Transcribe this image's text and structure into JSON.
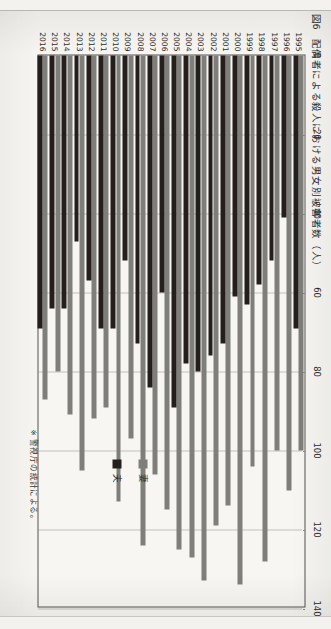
{
  "figure": {
    "number": "図6",
    "title": "配偶者による殺人における男女別被害者数（人）",
    "note": "※ 警視庁の統計による。"
  },
  "legend": {
    "position": "right",
    "items": [
      {
        "label": "妻",
        "color": "#7f7e7a"
      },
      {
        "label": "夫",
        "color": "#241f1c"
      }
    ]
  },
  "axis": {
    "ticks": [
      "0",
      "20",
      "40",
      "60",
      "80",
      "100",
      "120",
      "140"
    ]
  },
  "chart_data": {
    "type": "bar",
    "orientation": "horizontal",
    "xlabel": "",
    "ylabel": "人",
    "xlim": [
      0,
      140
    ],
    "tick_interval": 20,
    "grid": true,
    "legend_position": "right",
    "note": "※ 警視庁の統計による。",
    "categories": [
      "1995",
      "1996",
      "1997",
      "1998",
      "1999",
      "2000",
      "2001",
      "2002",
      "2003",
      "2004",
      "2005",
      "2006",
      "2007",
      "2008",
      "2009",
      "2010",
      "2011",
      "2012",
      "2013",
      "2014",
      "2015",
      "2016"
    ],
    "series": [
      {
        "name": "妻",
        "color": "#7f7e7a",
        "values": [
          100,
          110,
          100,
          128,
          104,
          134,
          114,
          119,
          133,
          127,
          125,
          115,
          106,
          124,
          97,
          113,
          89,
          92,
          105,
          91,
          80,
          87
        ]
      },
      {
        "name": "夫",
        "color": "#241f1c",
        "values": [
          69,
          41,
          52,
          58,
          63,
          61,
          73,
          76,
          80,
          78,
          89,
          60,
          84,
          73,
          52,
          69,
          69,
          57,
          47,
          64,
          64,
          69
        ]
      }
    ]
  }
}
